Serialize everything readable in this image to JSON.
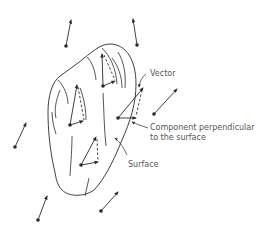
{
  "diagram": {
    "labels": {
      "vector": "Vector",
      "component_line1": "Component perpendicular",
      "component_line2": "to the surface",
      "surface": "Surface"
    },
    "colors": {
      "stroke": "#2a2a2a",
      "label": "#555555",
      "background": "#ffffff"
    }
  }
}
